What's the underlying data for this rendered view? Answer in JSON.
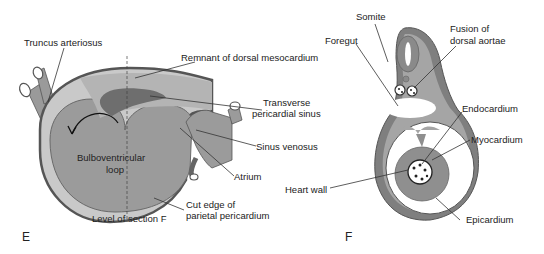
{
  "panels": {
    "E": {
      "letter": "E",
      "labels": {
        "truncus": "Truncus arteriosus",
        "remnant": "Remnant of dorsal mesocardium",
        "transverse_1": "Transverse",
        "transverse_2": "pericardial sinus",
        "bulbo_1": "Bulboventricular",
        "bulbo_2": "loop",
        "sinus_venosus": "Sinus venosus",
        "atrium": "Atrium",
        "cut_edge_1": "Cut edge of",
        "cut_edge_2": "parietal pericardium",
        "level": "Level of section F"
      }
    },
    "F": {
      "letter": "F",
      "labels": {
        "somite": "Somite",
        "foregut": "Foregut",
        "fusion_1": "Fusion of",
        "fusion_2": "dorsal aortae",
        "endocardium": "Endocardium",
        "myocardium": "Myocardium",
        "heart_wall": "Heart wall",
        "epicardium": "Epicardium"
      }
    }
  },
  "colors": {
    "outer": "#7a7a7a",
    "mid": "#a8a8a8",
    "light": "#c8c8c8",
    "dark": "#5e5e5e"
  }
}
